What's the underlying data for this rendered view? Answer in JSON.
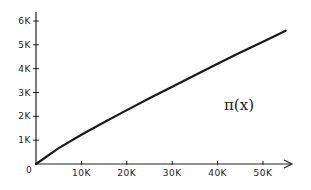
{
  "chart_data": {
    "type": "line",
    "title": "",
    "annotation": "π(x)",
    "xlabel": "",
    "ylabel": "",
    "xlim": [
      0,
      60000
    ],
    "ylim": [
      0,
      6200
    ],
    "grid": false,
    "legend": "none",
    "x_ticks": [
      {
        "value": 0,
        "label": "0"
      },
      {
        "value": 10000,
        "label": "10K"
      },
      {
        "value": 20000,
        "label": "20K"
      },
      {
        "value": 30000,
        "label": "30K"
      },
      {
        "value": 40000,
        "label": "40K"
      },
      {
        "value": 50000,
        "label": "50K"
      }
    ],
    "y_ticks": [
      {
        "value": 1000,
        "label": "1K"
      },
      {
        "value": 2000,
        "label": "2K"
      },
      {
        "value": 3000,
        "label": "3K"
      },
      {
        "value": 4000,
        "label": "4K"
      },
      {
        "value": 5000,
        "label": "5K"
      },
      {
        "value": 6000,
        "label": "6K"
      }
    ],
    "series": [
      {
        "name": "π(x)",
        "x": [
          0,
          5000,
          10000,
          15000,
          20000,
          25000,
          30000,
          35000,
          40000,
          45000,
          50000,
          55000
        ],
        "values": [
          0,
          669,
          1229,
          1754,
          2262,
          2762,
          3245,
          3727,
          4203,
          4675,
          5133,
          5590
        ]
      }
    ]
  }
}
